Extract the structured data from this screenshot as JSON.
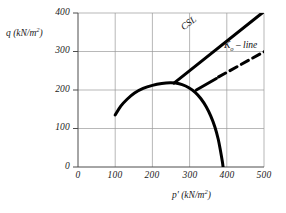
{
  "chart_data": {
    "type": "line",
    "title": "",
    "xlabel": "p' (kN/m2)",
    "ylabel": "q (kN/m2)",
    "xlim": [
      0,
      500
    ],
    "ylim": [
      0,
      400
    ],
    "grid": true,
    "legend_position": "inline-annotations",
    "xticks": [
      0,
      100,
      200,
      300,
      400,
      500
    ],
    "yticks": [
      0,
      100,
      200,
      300,
      400
    ],
    "xtick_labels": [
      "0",
      "100",
      "200",
      "300",
      "400",
      "500"
    ],
    "ytick_labels": [
      "0",
      "100",
      "200",
      "300",
      "400"
    ],
    "series": [
      {
        "name": "yield-surface",
        "style": "solid",
        "width": 3,
        "color": "#000000",
        "points": [
          [
            100,
            135
          ],
          [
            115,
            158
          ],
          [
            132,
            176
          ],
          [
            152,
            192
          ],
          [
            175,
            204
          ],
          [
            200,
            212
          ],
          [
            225,
            217
          ],
          [
            248,
            219
          ],
          [
            262,
            218
          ],
          [
            280,
            214
          ],
          [
            298,
            206
          ],
          [
            315,
            194
          ],
          [
            330,
            178
          ],
          [
            345,
            156
          ],
          [
            357,
            132
          ],
          [
            368,
            104
          ],
          [
            377,
            72
          ],
          [
            383,
            42
          ],
          [
            388,
            14
          ],
          [
            390,
            0
          ]
        ]
      },
      {
        "name": "critical-state-line",
        "style": "solid",
        "width": 3,
        "color": "#000000",
        "points": [
          [
            258,
            218
          ],
          [
            500,
            404
          ]
        ]
      },
      {
        "name": "k0-line-solid-segment",
        "style": "solid",
        "width": 3,
        "color": "#000000",
        "points": [
          [
            318,
            200
          ],
          [
            372,
            230
          ]
        ]
      },
      {
        "name": "k0-line-dashed-segment",
        "style": "dashed",
        "width": 3,
        "color": "#000000",
        "points": [
          [
            378,
            234
          ],
          [
            505,
            302
          ]
        ]
      }
    ],
    "annotations": [
      {
        "name": "csl-label",
        "text": "CSL",
        "x": 318,
        "y": 330,
        "rotation": -37
      },
      {
        "name": "k0-line-label",
        "text": "Ko – line",
        "x": 398,
        "y": 300,
        "rotation": 0
      }
    ]
  },
  "axes": {
    "y_title_main": "q",
    "y_title_unit": "(kN/m",
    "y_title_exp": "2",
    "y_title_close": ")",
    "x_title_main": "p'",
    "x_title_unit": "(kN/m",
    "x_title_exp": "2",
    "x_title_close": ")"
  },
  "labels": {
    "csl": "CSL",
    "k0_prefix": "K",
    "k0_sub": "o",
    "k0_suffix": " – line"
  },
  "colors": {
    "curve": "#000000",
    "grid": "#999999",
    "axis": "#4d4d4d",
    "text": "#1a1a1a",
    "background": "#ffffff"
  }
}
